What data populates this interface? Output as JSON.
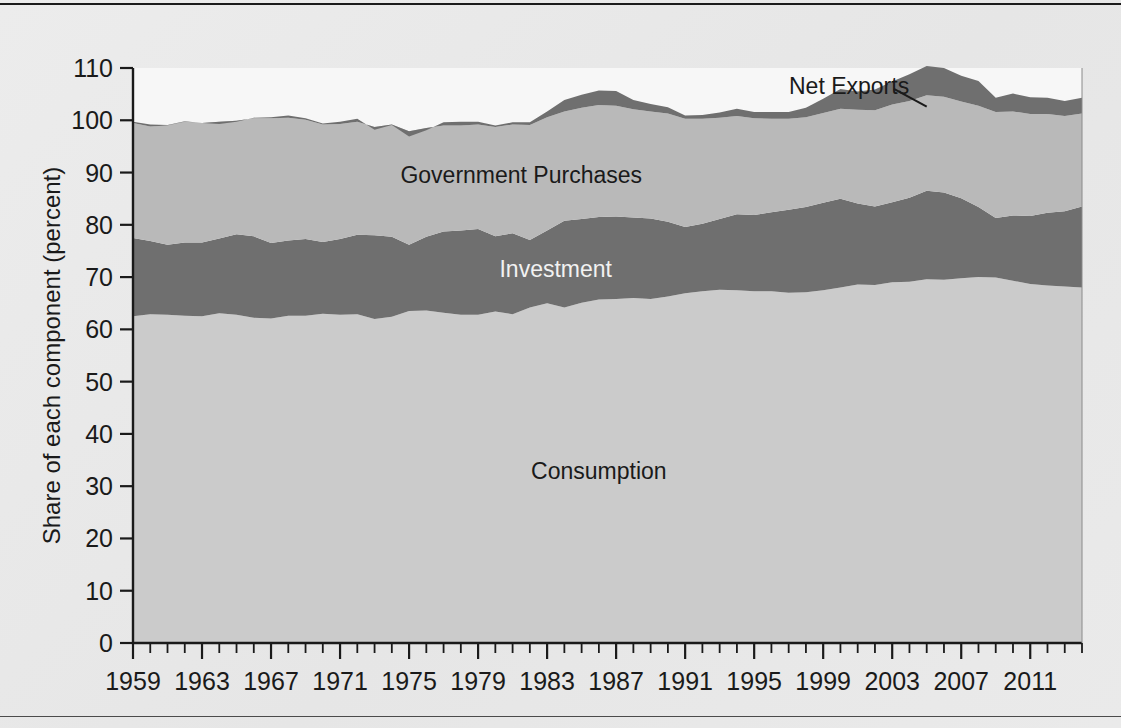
{
  "figure": {
    "background_color": "#e9e9e9",
    "rule_color": "#1b1b1b"
  },
  "chart_data": {
    "type": "area",
    "title": "",
    "subtitle": "",
    "xlabel": "",
    "ylabel": "Share of each component (percent)",
    "ylim": [
      0,
      110
    ],
    "xlim": [
      1959,
      2014
    ],
    "ytick_values": [
      0,
      10,
      20,
      30,
      40,
      50,
      60,
      70,
      80,
      90,
      100,
      110
    ],
    "ytick_labels": [
      "0",
      "10",
      "20",
      "30",
      "40",
      "50",
      "60",
      "70",
      "80",
      "90",
      "100",
      "110"
    ],
    "xtick_labels": [
      "1959",
      "1963",
      "1967",
      "1971",
      "1975",
      "1979",
      "1983",
      "1987",
      "1991",
      "1995",
      "1999",
      "2003",
      "2007",
      "2011"
    ],
    "xtick_values": [
      1959,
      1963,
      1967,
      1971,
      1975,
      1979,
      1983,
      1987,
      1991,
      1995,
      1999,
      2003,
      2007,
      2011
    ],
    "minor_tick_interval": 1,
    "grid": false,
    "legend_position": "inline-annotation",
    "stacked": true,
    "colors": {
      "consumption": "#cbcbcb",
      "investment": "#6f6f6f",
      "government": "#b9b9b9",
      "net_exports": "#6f6f6f",
      "plot_background": "#f7f7f7"
    },
    "annotations": [
      {
        "name": "consumption-label",
        "text": "Consumption",
        "x": 1986,
        "y": 33,
        "style": "dark"
      },
      {
        "name": "investment-label",
        "text": "Investment",
        "x": 1983.5,
        "y": 71.5,
        "style": "light"
      },
      {
        "name": "government-label",
        "text": "Government Purchases",
        "x": 1981.5,
        "y": 89.5,
        "style": "dark"
      },
      {
        "name": "net-exports-label",
        "text": "Net Exports",
        "x": 2000.5,
        "y": 106.6,
        "style": "dark"
      }
    ],
    "leader_line": {
      "name": "net-exports-leader",
      "from": [
        2003.1,
        106.0
      ],
      "to": [
        2005.0,
        102.6
      ]
    },
    "x": [
      1959,
      1960,
      1961,
      1962,
      1963,
      1964,
      1965,
      1966,
      1967,
      1968,
      1969,
      1970,
      1971,
      1972,
      1973,
      1974,
      1975,
      1976,
      1977,
      1978,
      1979,
      1980,
      1981,
      1982,
      1983,
      1984,
      1985,
      1986,
      1987,
      1988,
      1989,
      1990,
      1991,
      1992,
      1993,
      1994,
      1995,
      1996,
      1997,
      1998,
      1999,
      2000,
      2001,
      2002,
      2003,
      2004,
      2005,
      2006,
      2007,
      2008,
      2009,
      2010,
      2011,
      2012,
      2013,
      2014
    ],
    "series": [
      {
        "name": "Consumption",
        "key": "consumption",
        "color": "#cbcbcb",
        "values": [
          62.5,
          62.9,
          62.8,
          62.6,
          62.5,
          63.1,
          62.8,
          62.2,
          62.1,
          62.6,
          62.6,
          63.0,
          62.8,
          62.9,
          62.0,
          62.4,
          63.5,
          63.6,
          63.2,
          62.8,
          62.8,
          63.4,
          62.9,
          64.2,
          65.0,
          64.2,
          65.1,
          65.7,
          65.8,
          66.0,
          65.8,
          66.3,
          66.9,
          67.3,
          67.6,
          67.5,
          67.3,
          67.3,
          67.0,
          67.1,
          67.5,
          68.0,
          68.6,
          68.5,
          69.0,
          69.1,
          69.6,
          69.5,
          69.8,
          70.0,
          69.9,
          69.3,
          68.7,
          68.4,
          68.2,
          68.0
        ]
      },
      {
        "name": "Investment",
        "key": "investment",
        "color": "#6f6f6f",
        "values": [
          15.0,
          14.0,
          13.4,
          14.0,
          14.1,
          14.3,
          15.4,
          15.6,
          14.4,
          14.4,
          14.7,
          13.7,
          14.5,
          15.2,
          16.0,
          15.3,
          12.7,
          14.1,
          15.5,
          16.1,
          16.4,
          14.4,
          15.5,
          12.9,
          13.9,
          16.6,
          16.0,
          15.8,
          15.8,
          15.4,
          15.4,
          14.3,
          12.7,
          12.9,
          13.5,
          14.5,
          14.6,
          15.1,
          15.9,
          16.3,
          16.7,
          17.0,
          15.5,
          15.0,
          15.3,
          16.1,
          16.9,
          16.7,
          15.3,
          13.4,
          11.4,
          12.5,
          13.0,
          13.9,
          14.4,
          15.5
        ]
      },
      {
        "name": "Government Purchases",
        "key": "government",
        "color": "#b9b9b9",
        "values": [
          22.0,
          21.9,
          22.8,
          23.1,
          22.9,
          22.3,
          21.7,
          22.6,
          23.9,
          23.5,
          22.8,
          22.5,
          22.0,
          21.6,
          20.7,
          21.5,
          21.7,
          20.8,
          20.3,
          20.1,
          20.0,
          20.9,
          20.8,
          22.0,
          21.7,
          20.9,
          21.3,
          21.4,
          21.2,
          20.7,
          20.5,
          20.7,
          20.7,
          20.1,
          19.4,
          18.8,
          18.5,
          17.9,
          17.4,
          17.2,
          17.2,
          17.2,
          17.9,
          18.4,
          18.7,
          18.5,
          18.3,
          18.3,
          18.5,
          19.4,
          20.3,
          19.9,
          19.5,
          18.9,
          18.2,
          17.8
        ]
      },
      {
        "name": "Net Exports",
        "key": "net_exports",
        "color": "#6f6f6f",
        "values": [
          -0.2,
          -0.4,
          -0.1,
          -0.1,
          0.0,
          0.4,
          0.2,
          -0.1,
          -0.2,
          -0.4,
          -0.3,
          -0.2,
          -0.4,
          -0.6,
          0.5,
          0.1,
          1.0,
          0.4,
          -0.6,
          -0.7,
          -0.5,
          -0.3,
          -0.4,
          -0.5,
          -1.1,
          -2.2,
          -2.5,
          -2.8,
          -2.8,
          -1.8,
          -1.4,
          -1.2,
          -0.6,
          -0.7,
          -1.0,
          -1.4,
          -1.2,
          -1.3,
          -1.3,
          -1.8,
          -2.7,
          -3.8,
          -3.5,
          -4.0,
          -4.4,
          -5.1,
          -5.6,
          -5.5,
          -4.9,
          -4.7,
          -2.7,
          -3.4,
          -3.2,
          -3.1,
          -2.9,
          -3.0
        ]
      }
    ]
  }
}
